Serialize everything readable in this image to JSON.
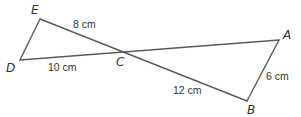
{
  "diagram": {
    "vertices": {
      "E": {
        "label": "E",
        "x": 40,
        "y": 19
      },
      "D": {
        "label": "D",
        "x": 20,
        "y": 60
      },
      "C": {
        "label": "C",
        "x": 121,
        "y": 51
      },
      "A": {
        "label": "A",
        "x": 279,
        "y": 40
      },
      "B": {
        "label": "B",
        "x": 247,
        "y": 101
      }
    },
    "measurements": {
      "EC": "8 cm",
      "DC": "10 cm",
      "CB": "12 cm",
      "AB": "6 cm"
    },
    "segments": [
      "ED",
      "EB",
      "DA",
      "AB"
    ],
    "stroke_color": "#5a5a5a"
  }
}
